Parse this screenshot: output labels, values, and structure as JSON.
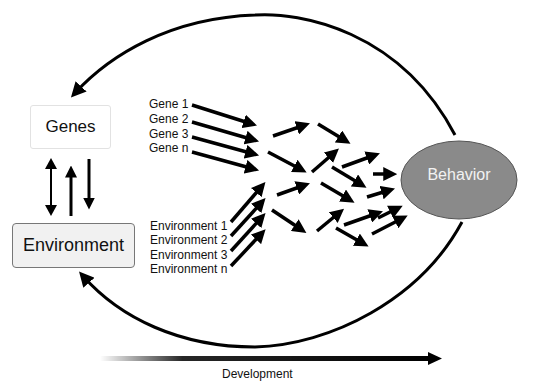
{
  "nodes": {
    "genes": "Genes",
    "environment": "Environment",
    "behavior": "Behavior"
  },
  "gene_inputs": [
    "Gene 1",
    "Gene 2",
    "Gene 3",
    "Gene n"
  ],
  "environment_inputs": [
    "Environment 1",
    "Environment 2",
    "Environment 3",
    "Environment n"
  ],
  "axis": {
    "label": "Development"
  },
  "colors": {
    "behavior_fill": "#8a8a8a",
    "behavior_stroke": "#555555",
    "arrow": "#000000",
    "environment_fill": "#f1f1f1"
  }
}
